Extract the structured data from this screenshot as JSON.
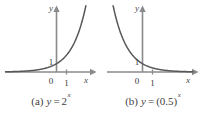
{
  "figure": {
    "title": "",
    "panels": [
      {
        "id": "a",
        "caption_label": "(a)",
        "caption_variable": "y",
        "caption_equals": "=",
        "caption_base": "2",
        "caption_exponent": "x",
        "caption_full": "(a) y = 2^x",
        "axis_x_label": "x",
        "axis_y_label": "y",
        "origin_label": "0",
        "y_intercept_label": "1",
        "x_tick_label": "1"
      },
      {
        "id": "b",
        "caption_label": "(b)",
        "caption_variable": "y",
        "caption_equals": "=",
        "caption_base": "(0.5)",
        "caption_exponent": "x",
        "caption_full": "(b) y = (0.5)^x",
        "axis_x_label": "x",
        "axis_y_label": "y",
        "origin_label": "0",
        "y_intercept_label": "1",
        "x_tick_label": "1"
      }
    ]
  },
  "colors": {
    "curve": "#58585a",
    "axis": "#8a8a8d",
    "text": "#3a3a3a",
    "background": "#ffffff"
  },
  "chart_data": [
    {
      "type": "line",
      "title": "(a) y = 2^x",
      "function": "y = 2^x",
      "base": 2,
      "xlabel": "x",
      "ylabel": "y",
      "xlim": [
        -3.6,
        3.2
      ],
      "ylim": [
        -0.6,
        8.2
      ],
      "grid": false,
      "legend": null,
      "x": [
        -3.5,
        -3,
        -2.5,
        -2,
        -1.5,
        -1,
        -0.5,
        0,
        0.5,
        1,
        1.5,
        2,
        2.5,
        3
      ],
      "y": [
        0.088,
        0.125,
        0.177,
        0.25,
        0.354,
        0.5,
        0.707,
        1,
        1.414,
        2,
        2.828,
        4,
        5.657,
        8
      ],
      "annotations": [
        {
          "text": "1",
          "role": "y-intercept",
          "x": 0,
          "y": 1
        },
        {
          "text": "0",
          "role": "origin",
          "x": 0,
          "y": 0
        },
        {
          "text": "1",
          "role": "x-tick",
          "x": 1,
          "y": 0
        }
      ]
    },
    {
      "type": "line",
      "title": "(b) y = (0.5)^x",
      "function": "y = (0.5)^x",
      "base": 0.5,
      "xlabel": "x",
      "ylabel": "y",
      "xlim": [
        -3.2,
        3.6
      ],
      "ylim": [
        -0.6,
        8.2
      ],
      "grid": false,
      "legend": null,
      "x": [
        -3,
        -2.5,
        -2,
        -1.5,
        -1,
        -0.5,
        0,
        0.5,
        1,
        1.5,
        2,
        2.5,
        3,
        3.5
      ],
      "y": [
        8,
        5.657,
        4,
        2.828,
        2,
        1.414,
        1,
        0.707,
        0.5,
        0.354,
        0.25,
        0.177,
        0.125,
        0.088
      ],
      "annotations": [
        {
          "text": "1",
          "role": "y-intercept",
          "x": 0,
          "y": 1
        },
        {
          "text": "0",
          "role": "origin",
          "x": 0,
          "y": 0
        },
        {
          "text": "1",
          "role": "x-tick",
          "x": 1,
          "y": 0
        }
      ]
    }
  ]
}
